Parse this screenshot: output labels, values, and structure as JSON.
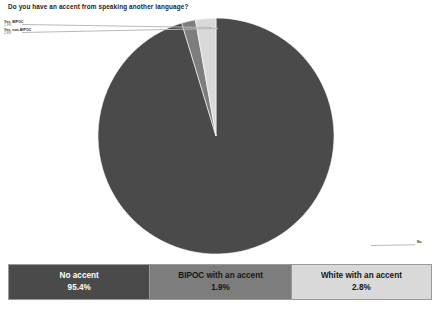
{
  "title": "Do you have an accent from speaking another language?",
  "callouts": [
    {
      "id": "bipoc",
      "name": "Yes, BIPOC",
      "value": "1.9%"
    },
    {
      "id": "non-bipoc",
      "name": "Yes, non-BIPOC",
      "value": "2.8%"
    },
    {
      "id": "no",
      "name": "No",
      "value": ""
    }
  ],
  "legend": {
    "cells": [
      {
        "label": "No accent",
        "value": "95.4%",
        "color": "#4a4a4a",
        "text_color": "#ffffff"
      },
      {
        "label": "BIPOC with an accent",
        "value": "1.9%",
        "color": "#7d7d7d",
        "text_color": "#161616"
      },
      {
        "label": "White with an accent",
        "value": "2.8%",
        "color": "#d9d9d9",
        "text_color": "#161616"
      }
    ]
  },
  "colors": {
    "no_accent": "#4a4a4a",
    "bipoc_accent": "#7d7d7d",
    "white_accent": "#d9d9d9",
    "background": "#ffffff",
    "border": "#9a9a9a"
  },
  "chart_data": {
    "type": "pie",
    "title": "Do you have an accent from speaking another language?",
    "categories": [
      "No accent",
      "BIPOC with an accent",
      "White with an accent"
    ],
    "values": [
      95.4,
      1.9,
      2.8
    ],
    "value_labels": [
      "95.4%",
      "1.9%",
      "2.8%"
    ],
    "colors": [
      "#4a4a4a",
      "#7d7d7d",
      "#d9d9d9"
    ],
    "unit": "percent",
    "total": 100.1,
    "start_angle": -90,
    "direction": "clockwise",
    "legend_position": "bottom",
    "grid": false,
    "xlabel": "",
    "ylabel": ""
  }
}
